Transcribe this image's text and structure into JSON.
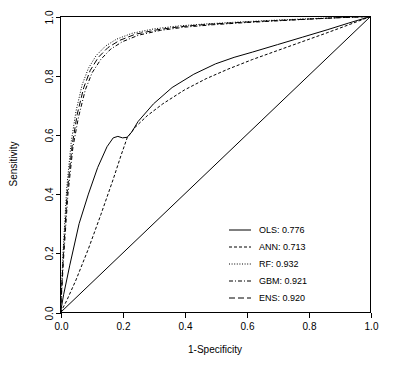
{
  "chart_data": {
    "type": "line",
    "title": "",
    "xlabel": "1-Specificity",
    "ylabel": "Sensitivity",
    "xlim": [
      0,
      1
    ],
    "ylim": [
      0,
      1
    ],
    "grid": false,
    "legend_position": "bottom-right",
    "xticks": [
      "0.0",
      "0.2",
      "0.4",
      "0.6",
      "0.8",
      "1.0"
    ],
    "xtick_values": [
      0.0,
      0.2,
      0.4,
      0.6,
      0.8,
      1.0
    ],
    "yticks": [
      "0.0",
      "0.2",
      "0.4",
      "0.6",
      "0.8",
      "1.0"
    ],
    "ytick_values": [
      0.0,
      0.2,
      0.4,
      0.6,
      0.8,
      1.0
    ],
    "legend": [
      {
        "label": "OLS: 0.776",
        "model": "OLS",
        "auc": 0.776,
        "dash": "none"
      },
      {
        "label": "ANN: 0.713",
        "model": "ANN",
        "auc": 0.713,
        "dash": "3,2"
      },
      {
        "label": "RF: 0.932",
        "model": "RF",
        "auc": 0.932,
        "dash": "1,1.6"
      },
      {
        "label": "GBM: 0.921",
        "model": "GBM",
        "auc": 0.921,
        "dash": "4,2,1,2"
      },
      {
        "label": "ENS: 0.920",
        "model": "ENS",
        "auc": 0.92,
        "dash": "6,3"
      }
    ],
    "reference_line": {
      "name": "chance-diagonal",
      "x": [
        0.0,
        1.0
      ],
      "y": [
        0.0,
        1.0
      ]
    },
    "series": [
      {
        "name": "OLS",
        "auc": 0.776,
        "dash": "none",
        "x": [
          0.0,
          0.01,
          0.03,
          0.06,
          0.09,
          0.12,
          0.15,
          0.17,
          0.185,
          0.2,
          0.215,
          0.23,
          0.25,
          0.3,
          0.36,
          0.43,
          0.5,
          0.56,
          0.62,
          0.7,
          0.78,
          0.86,
          0.93,
          1.0
        ],
        "y": [
          0.0,
          0.06,
          0.16,
          0.3,
          0.4,
          0.49,
          0.56,
          0.59,
          0.595,
          0.59,
          0.592,
          0.61,
          0.645,
          0.705,
          0.76,
          0.805,
          0.84,
          0.862,
          0.88,
          0.905,
          0.93,
          0.955,
          0.978,
          1.0
        ]
      },
      {
        "name": "ANN",
        "auc": 0.713,
        "dash": "3,2",
        "x": [
          0.0,
          0.02,
          0.05,
          0.09,
          0.13,
          0.17,
          0.195,
          0.215,
          0.24,
          0.28,
          0.33,
          0.4,
          0.47,
          0.54,
          0.62,
          0.7,
          0.78,
          0.86,
          0.93,
          1.0
        ],
        "y": [
          0.0,
          0.04,
          0.11,
          0.215,
          0.33,
          0.45,
          0.53,
          0.59,
          0.625,
          0.665,
          0.705,
          0.752,
          0.79,
          0.822,
          0.855,
          0.885,
          0.915,
          0.945,
          0.972,
          1.0
        ]
      },
      {
        "name": "RF",
        "auc": 0.932,
        "dash": "1,1.6",
        "x": [
          0.0,
          0.008,
          0.02,
          0.035,
          0.05,
          0.07,
          0.09,
          0.115,
          0.145,
          0.18,
          0.23,
          0.3,
          0.38,
          0.47,
          0.57,
          0.68,
          0.79,
          0.89,
          1.0
        ],
        "y": [
          0.0,
          0.2,
          0.42,
          0.58,
          0.68,
          0.77,
          0.825,
          0.868,
          0.9,
          0.923,
          0.943,
          0.958,
          0.968,
          0.975,
          0.981,
          0.987,
          0.992,
          0.996,
          1.0
        ]
      },
      {
        "name": "GBM",
        "auc": 0.921,
        "dash": "4,2,1,2",
        "x": [
          0.0,
          0.01,
          0.024,
          0.04,
          0.058,
          0.08,
          0.102,
          0.13,
          0.162,
          0.2,
          0.252,
          0.322,
          0.4,
          0.49,
          0.59,
          0.695,
          0.8,
          0.9,
          1.0
        ],
        "y": [
          0.0,
          0.185,
          0.4,
          0.558,
          0.66,
          0.752,
          0.81,
          0.855,
          0.89,
          0.915,
          0.937,
          0.953,
          0.964,
          0.972,
          0.979,
          0.985,
          0.991,
          0.996,
          1.0
        ]
      },
      {
        "name": "ENS",
        "auc": 0.92,
        "dash": "6,3",
        "x": [
          0.0,
          0.009,
          0.022,
          0.038,
          0.054,
          0.075,
          0.096,
          0.122,
          0.153,
          0.19,
          0.241,
          0.311,
          0.39,
          0.48,
          0.58,
          0.688,
          0.795,
          0.895,
          1.0
        ],
        "y": [
          0.0,
          0.192,
          0.41,
          0.568,
          0.67,
          0.76,
          0.818,
          0.862,
          0.895,
          0.919,
          0.94,
          0.955,
          0.966,
          0.974,
          0.98,
          0.986,
          0.991,
          0.996,
          1.0
        ]
      }
    ]
  }
}
